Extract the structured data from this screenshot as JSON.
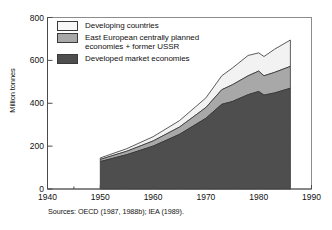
{
  "chart_data": {
    "type": "area",
    "stacked": true,
    "title": "",
    "xlabel": "",
    "ylabel": "Million tonnes",
    "xlim": [
      1940,
      1990
    ],
    "ylim": [
      0,
      800
    ],
    "xticks": [
      1940,
      1950,
      1960,
      1970,
      1980,
      1990
    ],
    "yticks": [
      0,
      200,
      400,
      600,
      800
    ],
    "minor_xtick_interval": 5,
    "grid": false,
    "legend_position": "upper-left-inside",
    "x": [
      1950,
      1955,
      1960,
      1965,
      1970,
      1973,
      1975,
      1978,
      1980,
      1981,
      1983,
      1986
    ],
    "series": [
      {
        "name": "Developed market economies",
        "color": "#4e4e4e",
        "values": [
          128,
          160,
          200,
          255,
          330,
          395,
          408,
          440,
          455,
          438,
          448,
          470
        ]
      },
      {
        "name": "East European centrally planned economies + former USSR",
        "color": "#a8a8a8",
        "values": [
          10,
          16,
          24,
          34,
          50,
          68,
          78,
          88,
          95,
          90,
          96,
          102
        ]
      },
      {
        "name": "Developing countries",
        "color": "#f2f2f2",
        "values": [
          7,
          12,
          20,
          30,
          45,
          65,
          78,
          95,
          85,
          90,
          108,
          123
        ]
      }
    ],
    "totals": [
      145,
      188,
      244,
      319,
      425,
      528,
      564,
      623,
      635,
      618,
      652,
      695
    ],
    "annotations": []
  },
  "legend": {
    "items": [
      {
        "label": "Developing countries",
        "color": "#f2f2f2"
      },
      {
        "label": "East European centrally planned\neconomies + former USSR",
        "color": "#a8a8a8"
      },
      {
        "label": "Developed market economies",
        "color": "#4e4e4e"
      }
    ]
  },
  "source_note": "Sources: OECD (1987, 1988b); IEA (1989).",
  "colors": {
    "axis": "#4a4a4a",
    "frame": "#8c8c8c",
    "text": "#111111",
    "background": "#ffffff"
  }
}
